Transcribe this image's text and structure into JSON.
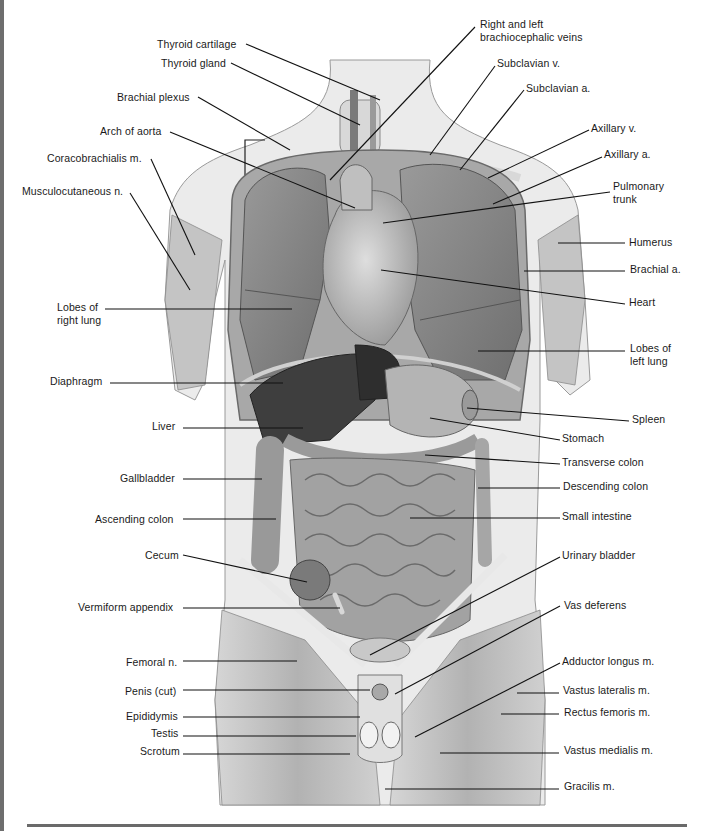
{
  "figure": {
    "left_labels": [
      {
        "id": "thyroid-cartilage",
        "text": "Thyroid cartilage",
        "x": 157,
        "y": 38,
        "lx1": 246,
        "ly1": 44,
        "lx2": 380,
        "ly2": 100
      },
      {
        "id": "thyroid-gland",
        "text": "Thyroid gland",
        "x": 161,
        "y": 57,
        "lx1": 231,
        "ly1": 63,
        "lx2": 360,
        "ly2": 125
      },
      {
        "id": "brachial-plexus",
        "text": "Brachial plexus",
        "x": 117,
        "y": 91,
        "lx1": 198,
        "ly1": 97,
        "lx2": 290,
        "ly2": 150
      },
      {
        "id": "arch-of-aorta",
        "text": "Arch of aorta",
        "x": 100,
        "y": 125,
        "lx1": 170,
        "ly1": 132,
        "lx2": 355,
        "ly2": 208
      },
      {
        "id": "coracobrachialis",
        "text": "Coracobrachialis m.",
        "x": 47,
        "y": 152,
        "lx1": 151,
        "ly1": 159,
        "lx2": 195,
        "ly2": 255
      },
      {
        "id": "musculocutaneous",
        "text": "Musculocutaneous n.",
        "x": 22,
        "y": 185,
        "lx1": 130,
        "ly1": 193,
        "lx2": 190,
        "ly2": 290
      },
      {
        "id": "lobes-right-lung",
        "text": "Lobes of\nright lung",
        "x": 57,
        "y": 301,
        "lx1": 105,
        "ly1": 309,
        "lx2": 292,
        "ly2": 309
      },
      {
        "id": "diaphragm",
        "text": "Diaphragm",
        "x": 50,
        "y": 375,
        "lx1": 110,
        "ly1": 383,
        "lx2": 283,
        "ly2": 383
      },
      {
        "id": "liver",
        "text": "Liver",
        "x": 152,
        "y": 420,
        "lx1": 183,
        "ly1": 428,
        "lx2": 303,
        "ly2": 428
      },
      {
        "id": "gallbladder",
        "text": "Gallbladder",
        "x": 120,
        "y": 472,
        "lx1": 183,
        "ly1": 479,
        "lx2": 262,
        "ly2": 479
      },
      {
        "id": "ascending-colon",
        "text": "Ascending colon",
        "x": 95,
        "y": 513,
        "lx1": 183,
        "ly1": 519,
        "lx2": 276,
        "ly2": 519
      },
      {
        "id": "cecum",
        "text": "Cecum",
        "x": 145,
        "y": 549,
        "lx1": 183,
        "ly1": 555,
        "lx2": 307,
        "ly2": 582
      },
      {
        "id": "vermiform-appendix",
        "text": "Vermiform appendix",
        "x": 78,
        "y": 601,
        "lx1": 183,
        "ly1": 608,
        "lx2": 340,
        "ly2": 608
      },
      {
        "id": "femoral-n",
        "text": "Femoral n.",
        "x": 126,
        "y": 656,
        "lx1": 183,
        "ly1": 661,
        "lx2": 297,
        "ly2": 661
      },
      {
        "id": "penis-cut",
        "text": "Penis (cut)",
        "x": 125,
        "y": 685,
        "lx1": 183,
        "ly1": 690,
        "lx2": 370,
        "ly2": 690
      },
      {
        "id": "epididymis",
        "text": "Epididymis",
        "x": 126,
        "y": 710,
        "lx1": 183,
        "ly1": 717,
        "lx2": 360,
        "ly2": 717
      },
      {
        "id": "testis",
        "text": "Testis",
        "x": 151,
        "y": 727,
        "lx1": 183,
        "ly1": 736,
        "lx2": 356,
        "ly2": 736
      },
      {
        "id": "scrotum",
        "text": "Scrotum",
        "x": 140,
        "y": 745,
        "lx1": 183,
        "ly1": 754,
        "lx2": 350,
        "ly2": 754
      }
    ],
    "right_labels": [
      {
        "id": "brachiocephalic-veins",
        "text": "Right and left\nbrachiocephalic veins",
        "x": 480,
        "y": 18,
        "lx1": 475,
        "ly1": 27,
        "lx2": 330,
        "ly2": 180
      },
      {
        "id": "subclavian-v",
        "text": "Subclavian v.",
        "x": 497,
        "y": 57,
        "lx1": 495,
        "ly1": 66,
        "lx2": 430,
        "ly2": 155
      },
      {
        "id": "subclavian-a",
        "text": "Subclavian a.",
        "x": 526,
        "y": 82,
        "lx1": 524,
        "ly1": 90,
        "lx2": 460,
        "ly2": 170
      },
      {
        "id": "axillary-v",
        "text": "Axillary v.",
        "x": 591,
        "y": 122,
        "lx1": 589,
        "ly1": 130,
        "lx2": 488,
        "ly2": 178
      },
      {
        "id": "axillary-a",
        "text": "Axillary a.",
        "x": 604,
        "y": 148,
        "lx1": 602,
        "ly1": 157,
        "lx2": 493,
        "ly2": 204
      },
      {
        "id": "pulmonary-trunk",
        "text": "Pulmonary\ntrunk",
        "x": 613,
        "y": 180,
        "lx1": 610,
        "ly1": 192,
        "lx2": 383,
        "ly2": 223
      },
      {
        "id": "humerus",
        "text": "Humerus",
        "x": 629,
        "y": 236,
        "lx1": 625,
        "ly1": 243,
        "lx2": 558,
        "ly2": 243
      },
      {
        "id": "brachial-a",
        "text": "Brachial a.",
        "x": 630,
        "y": 263,
        "lx1": 625,
        "ly1": 271,
        "lx2": 524,
        "ly2": 271
      },
      {
        "id": "heart",
        "text": "Heart",
        "x": 629,
        "y": 296,
        "lx1": 625,
        "ly1": 304,
        "lx2": 381,
        "ly2": 270
      },
      {
        "id": "lobes-left-lung",
        "text": "Lobes of\nleft lung",
        "x": 630,
        "y": 342,
        "lx1": 625,
        "ly1": 351,
        "lx2": 478,
        "ly2": 351
      },
      {
        "id": "spleen",
        "text": "Spleen",
        "x": 632,
        "y": 413,
        "lx1": 629,
        "ly1": 421,
        "lx2": 467,
        "ly2": 408
      },
      {
        "id": "stomach",
        "text": "Stomach",
        "x": 562,
        "y": 432,
        "lx1": 560,
        "ly1": 440,
        "lx2": 430,
        "ly2": 418
      },
      {
        "id": "transverse-colon",
        "text": "Transverse colon",
        "x": 562,
        "y": 456,
        "lx1": 560,
        "ly1": 464,
        "lx2": 425,
        "ly2": 455
      },
      {
        "id": "descending-colon",
        "text": "Descending colon",
        "x": 563,
        "y": 480,
        "lx1": 560,
        "ly1": 488,
        "lx2": 478,
        "ly2": 488
      },
      {
        "id": "small-intestine",
        "text": "Small intestine",
        "x": 562,
        "y": 510,
        "lx1": 560,
        "ly1": 518,
        "lx2": 410,
        "ly2": 518
      },
      {
        "id": "urinary-bladder",
        "text": "Urinary bladder",
        "x": 562,
        "y": 549,
        "lx1": 560,
        "ly1": 557,
        "lx2": 370,
        "ly2": 655
      },
      {
        "id": "vas-deferens",
        "text": "Vas deferens",
        "x": 564,
        "y": 599,
        "lx1": 560,
        "ly1": 606,
        "lx2": 395,
        "ly2": 694
      },
      {
        "id": "adductor-longus",
        "text": "Adductor longus m.",
        "x": 562,
        "y": 655,
        "lx1": 560,
        "ly1": 663,
        "lx2": 415,
        "ly2": 737
      },
      {
        "id": "vastus-lateralis",
        "text": "Vastus lateralis m.",
        "x": 563,
        "y": 684,
        "lx1": 559,
        "ly1": 693,
        "lx2": 517,
        "ly2": 693
      },
      {
        "id": "rectus-femoris",
        "text": "Rectus femoris m.",
        "x": 564,
        "y": 706,
        "lx1": 559,
        "ly1": 714,
        "lx2": 501,
        "ly2": 714
      },
      {
        "id": "vastus-medialis",
        "text": "Vastus medialis m.",
        "x": 564,
        "y": 744,
        "lx1": 559,
        "ly1": 753,
        "lx2": 440,
        "ly2": 753
      },
      {
        "id": "gracilis",
        "text": "Gracilis m.",
        "x": 564,
        "y": 780,
        "lx1": 559,
        "ly1": 789,
        "lx2": 385,
        "ly2": 789
      }
    ],
    "colors": {
      "ink": "#1a1a1a",
      "leader_line": "#111111",
      "border": "#6e6e6e",
      "skin": "#ececec",
      "muscle": "#bdbdbd",
      "organ_dark": "#4a4a4a",
      "organ_mid": "#8a8a8a",
      "organ_light": "#c8c8c8"
    }
  }
}
